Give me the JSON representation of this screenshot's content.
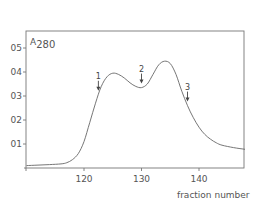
{
  "chart_data": {
    "type": "line",
    "title": "",
    "xlabel": "fraction number",
    "ylabel": "A280",
    "ylabel_main": "A",
    "ylabel_sub": "280",
    "xlim": [
      110,
      148
    ],
    "ylim": [
      0,
      0.58
    ],
    "grid": false,
    "x_ticks": [
      120,
      130,
      140
    ],
    "x_tick_labels": [
      "120",
      "130",
      "140"
    ],
    "y_ticks": [
      0.1,
      0.2,
      0.3,
      0.4,
      0.5
    ],
    "y_tick_labels": [
      "01",
      "02",
      "03",
      "04",
      "05"
    ],
    "series": [
      {
        "name": "A280",
        "x": [
          110,
          112,
          114,
          116,
          117,
          118,
          119,
          120,
          121,
          122,
          123,
          124,
          125,
          126,
          127,
          128,
          129,
          130,
          131,
          132,
          133,
          134,
          135,
          136,
          137,
          138,
          139,
          140,
          141,
          142,
          143,
          144,
          146,
          148
        ],
        "y": [
          0.01,
          0.012,
          0.014,
          0.017,
          0.022,
          0.035,
          0.06,
          0.11,
          0.19,
          0.27,
          0.34,
          0.38,
          0.395,
          0.39,
          0.375,
          0.355,
          0.34,
          0.335,
          0.35,
          0.39,
          0.43,
          0.445,
          0.435,
          0.39,
          0.32,
          0.26,
          0.21,
          0.17,
          0.14,
          0.12,
          0.105,
          0.095,
          0.085,
          0.078
        ]
      }
    ],
    "annotations": [
      {
        "label": "1",
        "x": 122.5,
        "type": "arrow-down"
      },
      {
        "label": "2",
        "x": 130,
        "type": "arrow-down"
      },
      {
        "label": "3",
        "x": 138,
        "type": "arrow-down"
      }
    ]
  }
}
